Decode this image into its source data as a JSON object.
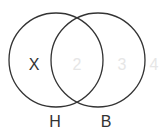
{
  "diagram": {
    "type": "venn",
    "sets": [
      {
        "id": "left",
        "label": "H",
        "cx": 56,
        "cy": 60,
        "r": 47
      },
      {
        "id": "right",
        "label": "B",
        "cx": 98,
        "cy": 60,
        "r": 47
      }
    ],
    "region_labels": {
      "left_only": "X",
      "intersection": "2",
      "right_only": "3",
      "outside": "4"
    },
    "colors": {
      "stroke": "#333333",
      "dark_text": "#333333",
      "faded_text": "#e6e6e6"
    }
  }
}
